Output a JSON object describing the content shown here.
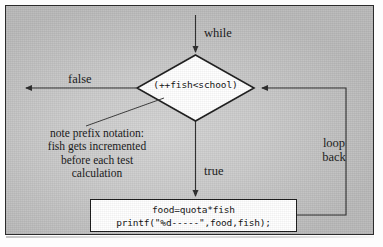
{
  "figure": {
    "kind": "flowchart"
  },
  "nodes": {
    "decision": {
      "name": "condition-diamond",
      "text": "(++fish<school)"
    },
    "process": {
      "name": "process-box",
      "lines": [
        "food=quota*fish",
        "printf(\"%d-----\",food,fish);"
      ]
    }
  },
  "labels": {
    "entry": "while",
    "false_branch": "false",
    "true_branch": "true",
    "loop_back_line1": "loop",
    "loop_back_line2": "back"
  },
  "annotation": {
    "name": "prefix-notation-note",
    "lines": [
      "note prefix notation:",
      "fish gets incremented",
      "before each test",
      "calculation"
    ]
  },
  "colors": {
    "frame_border": "#2b2b2b",
    "background_light": "#d4d4d4",
    "background_dark": "#b9b9b9",
    "shape_fill": "#ffffff",
    "line": "#2a2a2a",
    "text": "#151515"
  }
}
